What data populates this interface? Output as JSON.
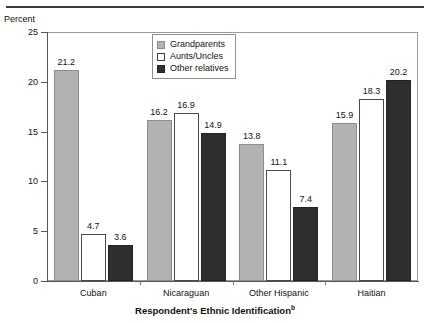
{
  "chart_data": {
    "type": "bar",
    "title": "",
    "xlabel": "Respondent's Ethnic Identification",
    "xlabel_superscript": "b",
    "ylabel": "Percent",
    "ylim": [
      0,
      25
    ],
    "yticks": [
      0,
      5,
      10,
      15,
      20,
      25
    ],
    "grid": false,
    "legend_position": "top-center",
    "categories": [
      "Cuban",
      "Nicaraguan",
      "Other Hispanic",
      "Haitian"
    ],
    "series": [
      {
        "name": "Grandparents",
        "color": "#b2b2b2",
        "values": [
          21.2,
          16.2,
          13.8,
          15.9
        ]
      },
      {
        "name": "Aunts/Uncles",
        "color": "#ffffff",
        "values": [
          4.7,
          16.9,
          11.1,
          18.3
        ]
      },
      {
        "name": "Other relatives",
        "color": "#2f2f2f",
        "values": [
          3.6,
          14.9,
          7.4,
          20.2
        ]
      }
    ]
  },
  "legend": {
    "items": [
      {
        "label": "Grandparents"
      },
      {
        "label": "Aunts/Uncles"
      },
      {
        "label": "Other relatives"
      }
    ]
  },
  "axis": {
    "unit_label": "Percent",
    "y_tick_labels": [
      "25",
      "20",
      "15",
      "10",
      "5",
      "0"
    ],
    "x_title_main": "Respondent's Ethnic Identification",
    "x_title_sup": "b"
  }
}
